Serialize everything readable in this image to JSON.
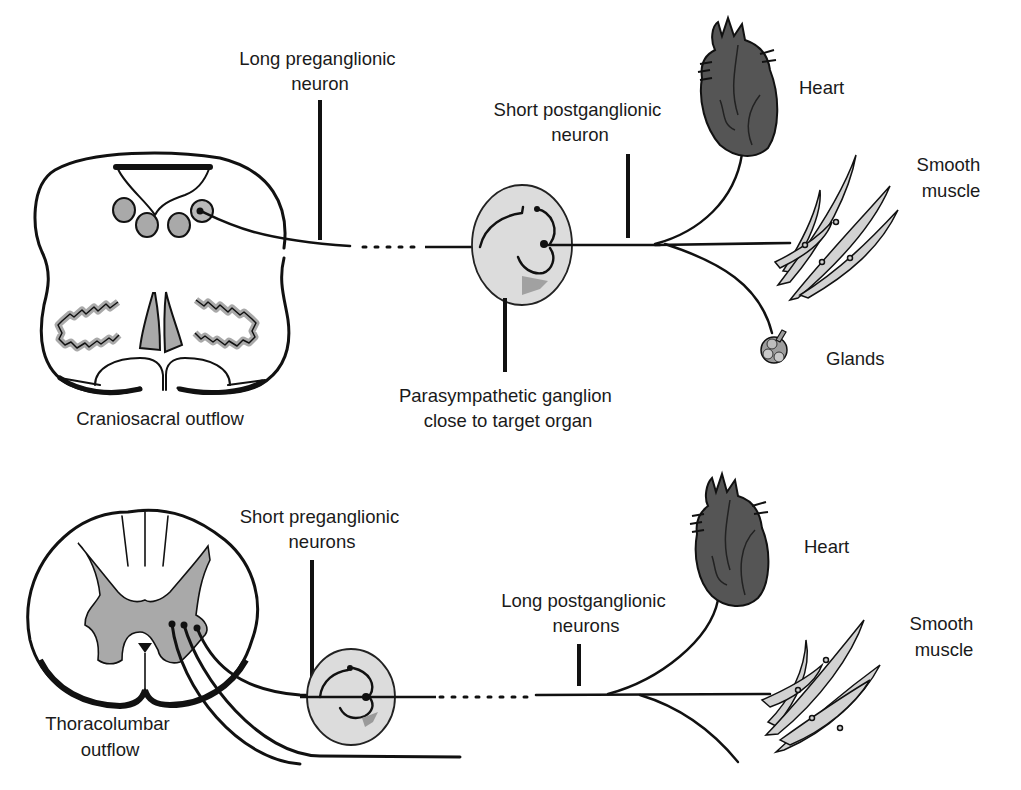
{
  "figure": {
    "panels": [
      {
        "id": "parasympathetic",
        "labels": {
          "outflow": "Craniosacral outflow",
          "preganglionic": [
            "Long preganglionic",
            "neuron"
          ],
          "postganglionic": [
            "Short postganglionic",
            "neuron"
          ],
          "ganglion": [
            "Parasympathetic ganglion",
            "close to target organ"
          ],
          "heart": "Heart",
          "smooth_muscle": [
            "Smooth",
            "muscle"
          ],
          "glands": "Glands"
        }
      },
      {
        "id": "sympathetic",
        "labels": {
          "outflow": [
            "Thoracolumbar",
            "outflow"
          ],
          "preganglionic": [
            "Short preganglionic",
            "neurons"
          ],
          "postganglionic": [
            "Long postganglionic",
            "neurons"
          ],
          "heart": "Heart",
          "smooth_muscle": [
            "Smooth",
            "muscle"
          ]
        }
      }
    ],
    "colors": {
      "ink": "#111111",
      "gray_fill": "#a9a9a9",
      "ganglion_fill": "#dcdcdc",
      "heart_fill": "#5a5a5a",
      "muscle_fill": "#d2d2d2",
      "background": "#ffffff"
    }
  }
}
